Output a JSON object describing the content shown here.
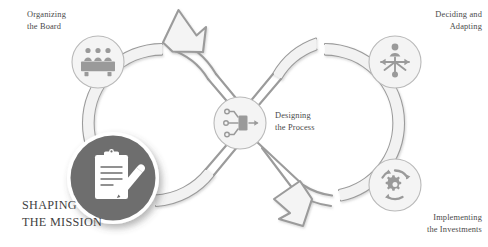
{
  "diagram": {
    "type": "figure-eight-process-loop",
    "background_color": "#ffffff",
    "palette": {
      "loop_stroke": "#9b9b9b",
      "loop_fill": "#f2f2f2",
      "node_circle_fill": "#f4f4f4",
      "node_circle_stroke": "#b9b9b9",
      "node_icon": "#9a9a9a",
      "hub_fill": "#6e6e6e",
      "hub_icon": "#ffffff",
      "hub_ring": "#ffffff",
      "label_text": "#4a4a4a",
      "mission_text": "#3f3f3f"
    }
  },
  "hub": {
    "name": "shaping-the-mission",
    "label": "SHAPING\nTHE MISSION",
    "icon": "clipboard-pencil-icon"
  },
  "center_node": {
    "name": "designing-the-process",
    "label": "Designing\nthe Process",
    "icon": "process-flow-icon"
  },
  "nodes": [
    {
      "name": "organizing-the-board",
      "label": "Organizing\nthe Board",
      "icon": "board-meeting-icon",
      "align": "left"
    },
    {
      "name": "deciding-and-adapting",
      "label": "Deciding and\nAdapting",
      "icon": "decision-branch-icon",
      "align": "right"
    },
    {
      "name": "implementing-the-investments",
      "label": "Implementing\nthe Investments",
      "icon": "gear-cycle-icon",
      "align": "right"
    }
  ],
  "arrows": [
    {
      "name": "left-loop-arrow",
      "direction": "up-right",
      "loop": "left"
    },
    {
      "name": "right-loop-arrow",
      "direction": "down-left",
      "loop": "right"
    }
  ]
}
